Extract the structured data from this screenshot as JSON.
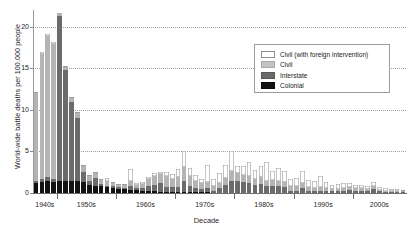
{
  "chart_data": {
    "type": "bar",
    "stacked": true,
    "title": "",
    "xlabel": "Decade",
    "ylabel": "World-wide battle deaths per 100,000 people",
    "ylim": [
      0,
      22
    ],
    "yticks": [
      0,
      5,
      10,
      15,
      20
    ],
    "ytick_labels": [
      "0",
      "5",
      "10",
      "15",
      "20"
    ],
    "grid": true,
    "grid_style": "dotted horizontal",
    "legend_position": "upper right",
    "xtick_labels": [
      "1940s",
      "1950s",
      "1960s",
      "1970s",
      "1980s",
      "1990s",
      "2000s"
    ],
    "x": [
      1946,
      1947,
      1948,
      1949,
      1950,
      1951,
      1952,
      1953,
      1954,
      1955,
      1956,
      1957,
      1958,
      1959,
      1960,
      1961,
      1962,
      1963,
      1964,
      1965,
      1966,
      1967,
      1968,
      1969,
      1970,
      1971,
      1972,
      1973,
      1974,
      1975,
      1976,
      1977,
      1978,
      1979,
      1980,
      1981,
      1982,
      1983,
      1984,
      1985,
      1986,
      1987,
      1988,
      1989,
      1990,
      1991,
      1992,
      1993,
      1994,
      1995,
      1996,
      1997,
      1998,
      1999,
      2000,
      2001,
      2002,
      2003,
      2004,
      2005,
      2006,
      2007,
      2008
    ],
    "series": [
      {
        "name": "Colonial",
        "color": "#121212",
        "values": [
          1.2,
          1.3,
          1.4,
          1.3,
          1.5,
          1.5,
          1.4,
          1.4,
          1.3,
          1.0,
          0.9,
          0.8,
          0.7,
          0.6,
          0.5,
          0.45,
          0.4,
          0.35,
          0.3,
          0.25,
          0.2,
          0.15,
          0.12,
          0.1,
          0.08,
          0.06,
          0.05,
          0.04,
          0.03,
          0.02,
          0,
          0,
          0,
          0,
          0,
          0,
          0,
          0,
          0,
          0,
          0,
          0,
          0,
          0,
          0,
          0,
          0,
          0,
          0,
          0,
          0,
          0,
          0,
          0,
          0,
          0,
          0,
          0,
          0,
          0,
          0,
          0,
          0
        ]
      },
      {
        "name": "Interstate",
        "color": "#6b6b6b",
        "values": [
          0.3,
          0.4,
          0.5,
          0.4,
          19.8,
          13.3,
          9.5,
          7.6,
          1.2,
          0.4,
          0.9,
          0.3,
          0.2,
          0.2,
          0.2,
          0.2,
          0.5,
          0.2,
          0.3,
          0.6,
          0.8,
          1.0,
          0.6,
          0.6,
          0.7,
          1.4,
          0.8,
          0.5,
          0.4,
          0.5,
          0.3,
          0.6,
          1.0,
          1.5,
          1.4,
          1.3,
          1.2,
          1.0,
          1.1,
          0.9,
          0.9,
          0.8,
          0.7,
          0.3,
          0.3,
          0.6,
          0.2,
          0.2,
          0.2,
          0.2,
          0.2,
          0.2,
          0.3,
          0.4,
          0.3,
          0.3,
          0.2,
          0.5,
          0.2,
          0.1,
          0.1,
          0.1,
          0.1
        ]
      },
      {
        "name": "Civil",
        "color": "#b4b4b4",
        "values": [
          10.5,
          15.0,
          17.0,
          16.2,
          0.3,
          0.4,
          0.5,
          0.6,
          0.8,
          0.7,
          0.6,
          0.5,
          0.5,
          0.4,
          0.3,
          0.3,
          0.5,
          0.4,
          0.5,
          0.8,
          1.0,
          1.1,
          1.3,
          1.0,
          1.1,
          1.6,
          1.2,
          0.9,
          0.7,
          0.8,
          0.5,
          0.6,
          0.8,
          1.2,
          1.0,
          0.9,
          0.8,
          0.7,
          0.8,
          0.6,
          0.7,
          0.6,
          0.6,
          0.5,
          0.5,
          0.6,
          0.5,
          0.4,
          0.5,
          0.4,
          0.3,
          0.3,
          0.3,
          0.3,
          0.3,
          0.3,
          0.25,
          0.3,
          0.2,
          0.2,
          0.15,
          0.15,
          0.1
        ]
      },
      {
        "name": "Civil (with foreign intervention)",
        "color": "#ffffff",
        "values": [
          0.1,
          0.2,
          0.2,
          0.2,
          0.1,
          0.1,
          0.1,
          0.1,
          0.1,
          0.1,
          0.1,
          0.1,
          0.4,
          0.1,
          0.1,
          0.1,
          1.5,
          0.2,
          0.2,
          0.3,
          0.4,
          0.3,
          0.5,
          0.6,
          1.0,
          2.0,
          1.0,
          0.7,
          0.6,
          2.0,
          0.9,
          1.2,
          1.6,
          2.3,
          0.9,
          1.1,
          1.7,
          1.1,
          1.4,
          2.2,
          1.0,
          1.6,
          1.3,
          0.9,
          1.0,
          1.4,
          0.9,
          0.8,
          1.3,
          0.7,
          0.5,
          0.6,
          0.6,
          0.5,
          0.4,
          0.4,
          0.35,
          0.5,
          0.3,
          0.25,
          0.2,
          0.2,
          0.15
        ]
      }
    ]
  },
  "axes": {
    "ylabel": "World-wide battle deaths per 100,000 people",
    "xlabel": "Decade"
  },
  "legend": {
    "items": [
      {
        "label": "Civil (with foreign intervention)",
        "swatch": "civilfi"
      },
      {
        "label": "Civil",
        "swatch": "civil"
      },
      {
        "label": "Interstate",
        "swatch": "interstate"
      },
      {
        "label": "Colonial",
        "swatch": "colonial"
      }
    ]
  }
}
